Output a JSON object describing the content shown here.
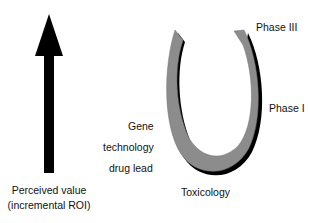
{
  "arrow": {
    "icon": "up-arrow-icon",
    "label_line1": "Perceived value",
    "label_line2": "(incremental ROI)"
  },
  "horseshoe": {
    "icon": "horseshoe-cycle-icon",
    "fill_color": "#8c8c8c",
    "shadow_color": "#000000"
  },
  "labels": {
    "gene": "Gene",
    "technology": "technology",
    "drug_lead": "drug lead",
    "toxicology": "Toxicology",
    "phase_1": "Phase I",
    "phase_3": "Phase III"
  }
}
